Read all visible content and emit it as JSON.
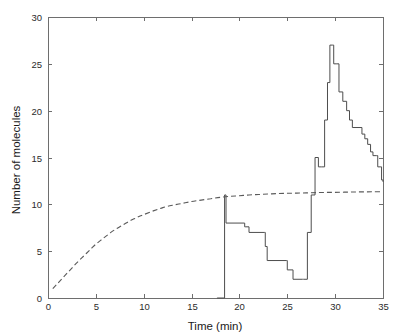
{
  "chart_data": {
    "type": "line",
    "title": "",
    "xlabel": "Time (min)",
    "ylabel": "Number of molecules",
    "xlim": [
      0,
      35
    ],
    "ylim": [
      0,
      30
    ],
    "xticks": [
      0,
      5,
      10,
      15,
      20,
      25,
      30,
      35
    ],
    "yticks": [
      0,
      5,
      10,
      15,
      20,
      25,
      30
    ],
    "xtick_labels": [
      "0",
      "5",
      "10",
      "15",
      "20",
      "25",
      "30",
      "35"
    ],
    "ytick_labels": [
      "0",
      "5",
      "10",
      "15",
      "20",
      "25",
      "30"
    ],
    "grid": false,
    "legend": "none",
    "series": [
      {
        "name": "stochastic-trajectory",
        "style": "solid",
        "color": "#4d4d4d",
        "drawstyle": "steps-post",
        "points": [
          [
            17.65,
            0
          ],
          [
            17.7,
            0
          ],
          [
            18.45,
            11
          ],
          [
            18.5,
            11
          ],
          [
            18.6,
            8
          ],
          [
            20.5,
            8
          ],
          [
            20.55,
            7.6
          ],
          [
            20.6,
            7.6
          ],
          [
            21.0,
            7
          ],
          [
            22.6,
            7
          ],
          [
            22.7,
            5.5
          ],
          [
            22.9,
            4
          ],
          [
            24.9,
            4
          ],
          [
            25.0,
            3
          ],
          [
            25.5,
            3
          ],
          [
            25.6,
            2
          ],
          [
            26.6,
            2
          ],
          [
            26.7,
            2
          ],
          [
            27.1,
            7
          ],
          [
            27.5,
            11
          ],
          [
            27.9,
            15
          ],
          [
            28.0,
            15
          ],
          [
            28.25,
            14
          ],
          [
            28.6,
            14
          ],
          [
            28.9,
            19
          ],
          [
            29.2,
            23
          ],
          [
            29.45,
            27
          ],
          [
            29.7,
            27
          ],
          [
            29.85,
            25
          ],
          [
            30.1,
            25
          ],
          [
            30.4,
            22
          ],
          [
            30.8,
            21
          ],
          [
            31.2,
            20
          ],
          [
            31.5,
            19
          ],
          [
            31.8,
            18.2
          ],
          [
            32.6,
            18.2
          ],
          [
            32.8,
            17.5
          ],
          [
            33.1,
            17
          ],
          [
            33.4,
            16.4
          ],
          [
            33.7,
            15.6
          ],
          [
            33.95,
            15.2
          ],
          [
            34.3,
            15.2
          ],
          [
            34.45,
            14
          ],
          [
            34.7,
            14
          ],
          [
            34.85,
            12.6
          ],
          [
            35.0,
            12.4
          ]
        ]
      },
      {
        "name": "deterministic-mean",
        "style": "dashed",
        "color": "#5a5a5a",
        "drawstyle": "smooth",
        "description": "Saturating exponential approach to ~11.35 molecules",
        "points": [
          [
            0.5,
            1.0
          ],
          [
            1.0,
            1.55
          ],
          [
            1.5,
            2.1
          ],
          [
            2.0,
            2.65
          ],
          [
            2.5,
            3.2
          ],
          [
            3.0,
            3.75
          ],
          [
            3.5,
            4.25
          ],
          [
            4.0,
            4.75
          ],
          [
            4.5,
            5.25
          ],
          [
            5.0,
            5.75
          ],
          [
            5.5,
            6.15
          ],
          [
            6.0,
            6.55
          ],
          [
            6.5,
            6.95
          ],
          [
            7.0,
            7.3
          ],
          [
            7.5,
            7.6
          ],
          [
            8.0,
            7.9
          ],
          [
            8.5,
            8.2
          ],
          [
            9.0,
            8.45
          ],
          [
            9.5,
            8.7
          ],
          [
            10.0,
            8.9
          ],
          [
            11.0,
            9.3
          ],
          [
            12.0,
            9.65
          ],
          [
            13.0,
            9.9
          ],
          [
            14.0,
            10.1
          ],
          [
            15.0,
            10.3
          ],
          [
            16.0,
            10.45
          ],
          [
            17.0,
            10.6
          ],
          [
            18.0,
            10.75
          ],
          [
            19.0,
            10.85
          ],
          [
            20.0,
            10.92
          ],
          [
            21.0,
            11.0
          ],
          [
            22.0,
            11.05
          ],
          [
            23.0,
            11.1
          ],
          [
            24.0,
            11.15
          ],
          [
            25.0,
            11.18
          ],
          [
            26.0,
            11.2
          ],
          [
            27.0,
            11.22
          ],
          [
            28.0,
            11.25
          ],
          [
            29.0,
            11.27
          ],
          [
            30.0,
            11.28
          ],
          [
            31.0,
            11.3
          ],
          [
            32.0,
            11.32
          ],
          [
            33.0,
            11.33
          ],
          [
            34.0,
            11.34
          ],
          [
            35.0,
            11.35
          ]
        ]
      }
    ]
  },
  "axes": {
    "x_axis_name": "Time (min)",
    "y_axis_name": "Number of molecules"
  }
}
